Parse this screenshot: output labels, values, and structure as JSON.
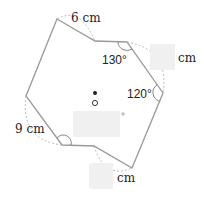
{
  "diagram": {
    "type": "octagon-geometry-figure",
    "labels": {
      "top_edge": "6 cm",
      "right_upper_edge": "cm",
      "left_lower_edge": "9 cm",
      "bottom_right_edge": "cm"
    },
    "angles": {
      "top_right": "130°",
      "right": "120°"
    },
    "colors": {
      "outline": "#9a9a9a",
      "dashed": "#a8a8a8",
      "text": "#222222",
      "hidden_box": "#f0f0f0"
    }
  }
}
